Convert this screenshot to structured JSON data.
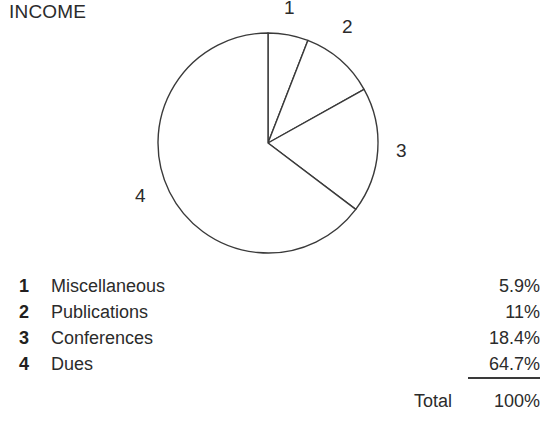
{
  "title": "INCOME",
  "colors": {
    "text": "#2b2b2b",
    "stroke": "#3a3a3a",
    "background": "#ffffff",
    "slice_fill": "#ffffff"
  },
  "pie": {
    "center_x": 268,
    "center_y": 143,
    "radius": 110,
    "start_angle_deg": 0,
    "direction": "clockwise",
    "slice_labels": [
      "1",
      "2",
      "3",
      "4"
    ]
  },
  "legend": {
    "rows": [
      {
        "key": "1",
        "label": "Miscellaneous",
        "value": "5.9%"
      },
      {
        "key": "2",
        "label": "Publications",
        "value": "11%"
      },
      {
        "key": "3",
        "label": "Conferences",
        "value": "18.4%"
      },
      {
        "key": "4",
        "label": "Dues",
        "value": "64.7%"
      }
    ]
  },
  "total": {
    "label": "Total",
    "value": "100%"
  },
  "chart_data": {
    "type": "pie",
    "title": "INCOME",
    "xlabel": "",
    "ylabel": "",
    "categories": [
      "Miscellaneous",
      "Publications",
      "Conferences",
      "Dues"
    ],
    "values": [
      5.9,
      11.0,
      18.4,
      64.7
    ],
    "value_labels": [
      "5.9%",
      "11%",
      "18.4%",
      "64.7%"
    ],
    "slice_keys": [
      "1",
      "2",
      "3",
      "4"
    ],
    "units": "percent",
    "total": 100,
    "total_label": "100%",
    "start_angle_deg": 90,
    "direction": "clockwise",
    "legend": "table-below",
    "grid": false,
    "filled": false,
    "annotations": [
      "1",
      "2",
      "3",
      "4"
    ]
  }
}
